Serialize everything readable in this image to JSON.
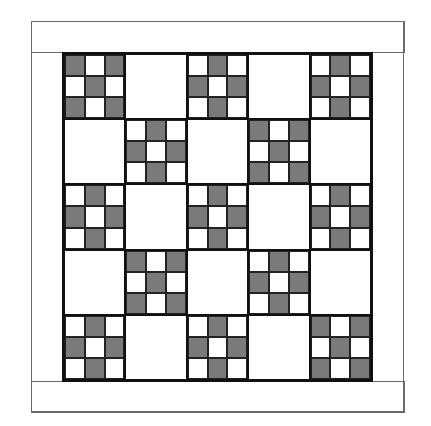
{
  "colors": {
    "dark": "#7a7a7a",
    "light": "#ffffff",
    "line": "#111111",
    "border_line": "#6a6a6a"
  },
  "patterns": {
    "X": [
      1,
      0,
      1,
      0,
      1,
      0,
      1,
      0,
      1
    ],
    "plus": [
      0,
      1,
      0,
      1,
      0,
      1,
      0,
      1,
      0
    ]
  },
  "quilt": {
    "rows": 5,
    "cols": 5,
    "layout": [
      [
        "X",
        "blank",
        "plus",
        "blank",
        "plus"
      ],
      [
        "blank",
        "plus",
        "blank",
        "X",
        "blank"
      ],
      [
        "plus",
        "blank",
        "plus",
        "blank",
        "plus"
      ],
      [
        "blank",
        "X",
        "blank",
        "plus",
        "blank"
      ],
      [
        "plus",
        "blank",
        "plus",
        "blank",
        "X"
      ]
    ]
  }
}
